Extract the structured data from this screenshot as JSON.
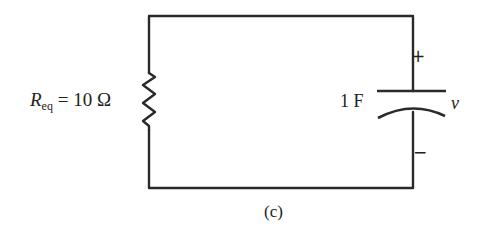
{
  "figure": {
    "caption": "(c)",
    "resistor": {
      "symbol": "R",
      "subscript": "eq",
      "equals": " = ",
      "value": "10 Ω"
    },
    "capacitor": {
      "value": "1 F",
      "voltage_label": "ν",
      "positive_terminal": "+",
      "negative_terminal": "−"
    }
  },
  "colors": {
    "wire": "#2a2a2a",
    "background": "#ffffff"
  }
}
